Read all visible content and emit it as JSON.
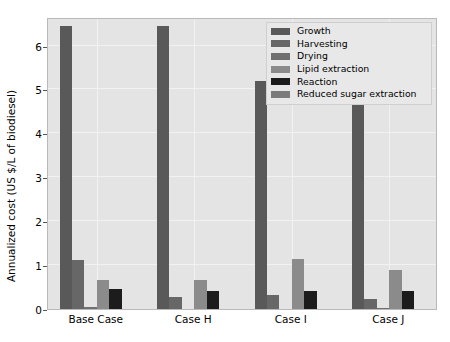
{
  "chart_data": {
    "type": "bar",
    "title": "",
    "xlabel": "",
    "ylabel": "Annualized cost (US $/L of biodiesel)",
    "categories": [
      "Base Case",
      "Case H",
      "Case I",
      "Case J"
    ],
    "ylim": [
      0,
      6.65
    ],
    "yticks": [
      0,
      1,
      2,
      3,
      4,
      5,
      6
    ],
    "ytick_labels": [
      "0",
      "1",
      "2",
      "3",
      "4",
      "5",
      "6"
    ],
    "grid": true,
    "legend_position": "upper right",
    "series": [
      {
        "name": "Growth",
        "color": "#595959",
        "values": [
          6.45,
          6.45,
          5.2,
          4.9
        ]
      },
      {
        "name": "Harvesting",
        "color": "#676767",
        "values": [
          1.12,
          0.27,
          0.33,
          0.22
        ]
      },
      {
        "name": "Drying",
        "color": "#707070",
        "values": [
          0.04,
          0.0,
          0.0,
          0.03
        ]
      },
      {
        "name": "Lipid extraction",
        "color": "#8b8b8b",
        "values": [
          0.65,
          0.65,
          1.15,
          0.88
        ]
      },
      {
        "name": "Reaction",
        "color": "#1c1c1c",
        "values": [
          0.45,
          0.4,
          0.4,
          0.4
        ]
      },
      {
        "name": "Reduced sugar extraction",
        "color": "#7b7b7b",
        "values": [
          0.0,
          0.0,
          0.0,
          0.0
        ]
      }
    ]
  },
  "figure": {
    "background_color": "#ffffff",
    "axes_background_color": "#e4e4e4",
    "grid_color": "#f2f2f2"
  }
}
